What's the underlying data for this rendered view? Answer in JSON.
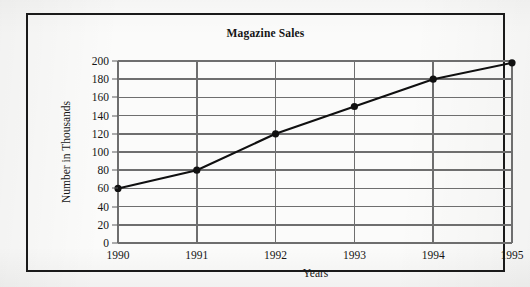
{
  "figure": {
    "title": "Magazine Sales",
    "background_color": "#fbfbfa",
    "frame_color": "#1a1a1a",
    "grid_color": "#6e6e6e",
    "series_color": "#101010"
  },
  "chart_data": {
    "type": "line",
    "title": "Magazine Sales",
    "xlabel": "Years",
    "ylabel": "Number in Thousands",
    "categories": [
      "1990",
      "1991",
      "1992",
      "1993",
      "1994",
      "1995"
    ],
    "x": [
      1990,
      1991,
      1992,
      1993,
      1994,
      1995
    ],
    "values": [
      60,
      80,
      120,
      150,
      180,
      198
    ],
    "series": [
      {
        "name": "Magazine Sales",
        "values": [
          60,
          80,
          120,
          150,
          180,
          198
        ],
        "marker": "filled-circle",
        "color": "#101010"
      }
    ],
    "xlim": [
      1990,
      1995
    ],
    "ylim": [
      0,
      200
    ],
    "ytick_labels": [
      "200",
      "180",
      "160",
      "140",
      "120",
      "100",
      "80",
      "60",
      "40",
      "20",
      "0"
    ],
    "ytick_values": [
      200,
      180,
      160,
      140,
      120,
      100,
      80,
      60,
      40,
      20,
      0
    ],
    "xtick_labels": [
      "1990",
      "1991",
      "1992",
      "1993",
      "1994",
      "1995"
    ],
    "grid": "both",
    "legend": "none"
  }
}
